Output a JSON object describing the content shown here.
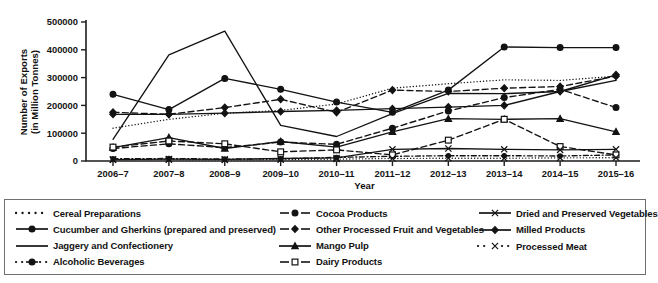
{
  "chart_data": {
    "type": "line",
    "title": "",
    "xlabel": "Year",
    "ylabel": "Number of Exports (in Million Tonnes)",
    "ylabel_line1": "Number of Exports",
    "ylabel_line2": "(in Million Tonnes)",
    "ylim": [
      0,
      500000
    ],
    "yticks": [
      0,
      100000,
      200000,
      300000,
      400000,
      500000
    ],
    "ytick_labels": [
      "0",
      "100000",
      "200000",
      "300000",
      "400000",
      "500000"
    ],
    "grid": false,
    "legend_position": "bottom",
    "categories": [
      "2006–7",
      "2007–8",
      "2008–9",
      "2009–10",
      "2010–11",
      "2011–12",
      "2012–13",
      "2013–14",
      "2014–15",
      "2015–16"
    ],
    "series": [
      {
        "name": "Cereal Preparations",
        "marker": "none",
        "line": "dotted",
        "values": [
          118000,
          150000,
          172000,
          182000,
          205000,
          262000,
          278000,
          292000,
          290000,
          305000
        ]
      },
      {
        "name": "Cucumber and Gherkins (prepared and preserved)",
        "marker": "filled-circle",
        "line": "solid",
        "values": [
          240000,
          185000,
          297000,
          258000,
          212000,
          175000,
          255000,
          410000,
          408000,
          408000
        ]
      },
      {
        "name": "Jaggery and Confectionery",
        "marker": "none",
        "line": "solid",
        "values": [
          78000,
          382000,
          467000,
          128000,
          88000,
          170000,
          243000,
          242000,
          250000,
          290000
        ]
      },
      {
        "name": "Alcoholic Beverages",
        "marker": "filled-circle-small",
        "line": "dash-dot",
        "values": [
          8000,
          9000,
          7000,
          8000,
          13000,
          17000,
          19000,
          19000,
          18000,
          22000
        ]
      },
      {
        "name": "Cocoa Products",
        "marker": "filled-circle",
        "line": "dashed",
        "values": [
          45000,
          62000,
          48000,
          68000,
          60000,
          118000,
          180000,
          228000,
          258000,
          192000
        ]
      },
      {
        "name": "Other Processed Fruit and Vegetables",
        "marker": "filled-diamond",
        "line": "dashed",
        "values": [
          175000,
          168000,
          192000,
          222000,
          175000,
          255000,
          250000,
          262000,
          268000,
          305000
        ]
      },
      {
        "name": "Mango Pulp",
        "marker": "filled-triangle",
        "line": "solid",
        "values": [
          48000,
          84000,
          45000,
          70000,
          50000,
          105000,
          152000,
          150000,
          152000,
          105000
        ]
      },
      {
        "name": "Dairy Products",
        "marker": "open-square",
        "line": "dashed",
        "values": [
          50000,
          72000,
          62000,
          33000,
          40000,
          22000,
          75000,
          150000,
          52000,
          22000
        ]
      },
      {
        "name": "Dried and Preserved Vegetables",
        "marker": "cross-x",
        "line": "solid",
        "values": [
          5000,
          7000,
          6000,
          9000,
          11000,
          42000,
          45000,
          42000,
          40000,
          42000
        ]
      },
      {
        "name": "Milled Products",
        "marker": "filled-diamond",
        "line": "solid",
        "values": [
          168000,
          168000,
          172000,
          178000,
          182000,
          188000,
          194000,
          200000,
          250000,
          310000
        ]
      },
      {
        "name": "Processed Meat",
        "marker": "cross-x-dot",
        "line": "dotted",
        "values": [
          5000,
          5000,
          4000,
          5000,
          7000,
          9000,
          10000,
          10000,
          11000,
          12000
        ]
      }
    ],
    "legend_columns": [
      [
        {
          "name": "Cereal Preparations",
          "style": "dotted-nomarker"
        },
        {
          "name": "Cucumber and Gherkins (prepared and preserved)",
          "style": "solid-circle"
        },
        {
          "name": "Jaggery and Confectionery",
          "style": "solid-nomarker"
        },
        {
          "name": "Alcoholic Beverages",
          "style": "dashdot-circle"
        }
      ],
      [
        {
          "name": "Cocoa Products",
          "style": "dashed-circle"
        },
        {
          "name": "Other Processed Fruit and Vegetables",
          "style": "dashed-diamond"
        },
        {
          "name": "Mango Pulp",
          "style": "solid-triangle"
        },
        {
          "name": "Dairy Products",
          "style": "dashed-opensquare"
        }
      ],
      [
        {
          "name": "Dried and Preserved Vegetables",
          "style": "solid-cross"
        },
        {
          "name": "Milled Products",
          "style": "solid-diamond"
        },
        {
          "name": "Processed Meat",
          "style": "dotted-cross"
        }
      ]
    ]
  },
  "colors": {
    "ink": "#131313",
    "frame": "#6f6f6f",
    "background": "#ffffff"
  }
}
